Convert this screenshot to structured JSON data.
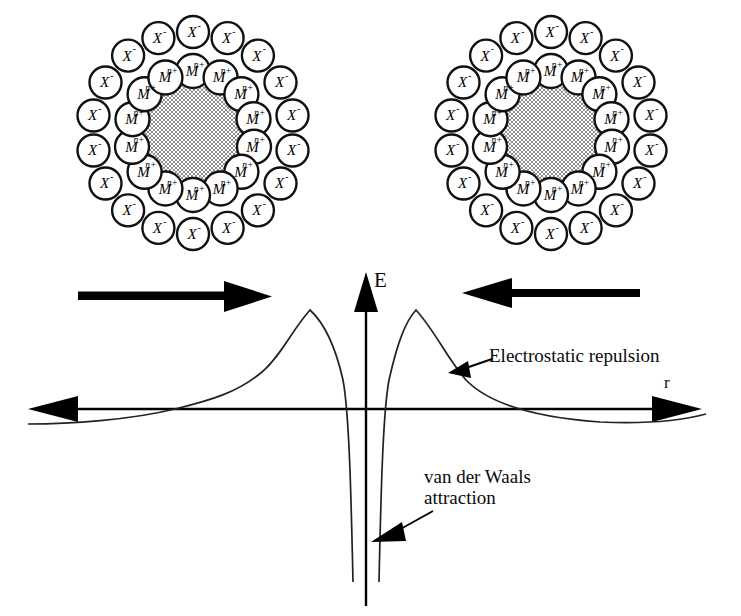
{
  "figure": {
    "type": "dlvo-interaction-energy-diagram",
    "background_color": "#ffffff",
    "stroke_color": "#000000"
  },
  "particles": {
    "core_label": "colloid-core",
    "core_fill_pattern": "checkerboard-gray",
    "core_fill_color": "#8c8c8c",
    "inner_ion": {
      "symbol": "M",
      "charge": "n+",
      "count": 14,
      "name": "metal-cation"
    },
    "outer_ion": {
      "symbol": "X",
      "charge": "-",
      "count": 18,
      "name": "counter-anion"
    },
    "left": {
      "name": "left-colloid-particle",
      "cx": 193,
      "cy": 133
    },
    "right": {
      "name": "right-colloid-particle",
      "cx": 551,
      "cy": 133
    }
  },
  "approach_arrows": {
    "left": {
      "label": "approach-arrow-right",
      "direction": "right",
      "x1": 78,
      "x2": 268,
      "y": 296
    },
    "right": {
      "label": "approach-arrow-left",
      "direction": "left",
      "x1": 638,
      "x2": 462,
      "y": 293
    }
  },
  "axes": {
    "y_label": "E",
    "x_label": "r",
    "y_axis_name": "interaction-energy-axis",
    "x_axis_name": "separation-distance-axis",
    "origin_x": 366,
    "origin_y": 409,
    "x_left_end": 28,
    "x_right_end": 700,
    "y_top_end": 272,
    "y_bottom_end": 606
  },
  "annotations": [
    {
      "name": "electrostatic-repulsion-label",
      "text": "Electrostatic repulsion",
      "lines": [
        "Electrostatic repulsion"
      ],
      "x": 489,
      "y": 345,
      "leader_from": [
        486,
        362
      ],
      "leader_to": [
        451,
        374
      ]
    },
    {
      "name": "van-der-waals-attraction-label",
      "text": "van der Waals attraction",
      "lines": [
        "van der Waals",
        "attraction"
      ],
      "x": 424,
      "y": 466,
      "leader_from": [
        430,
        513
      ],
      "leader_to": [
        373,
        541
      ]
    }
  ],
  "chart_data": {
    "type": "line",
    "title": "",
    "xlabel": "r",
    "ylabel": "E",
    "grid": false,
    "legend": null,
    "symmetry": "mirror-symmetric about the energy axis",
    "axis_ranges": {
      "x": [
        -1,
        1
      ],
      "y": [
        -1,
        1
      ]
    },
    "features": [
      {
        "name": "primary-maximum-left",
        "x": -0.42,
        "y": 0.78
      },
      {
        "name": "primary-maximum-right",
        "x": 0.42,
        "y": 0.78
      },
      {
        "name": "primary-minimum",
        "x": 0.0,
        "y": -1.0
      },
      {
        "name": "secondary-minimum-left",
        "x": -0.82,
        "y": -0.09
      },
      {
        "name": "secondary-minimum-right",
        "x": 0.82,
        "y": -0.09
      },
      {
        "name": "zero-crossing-left-inner",
        "x": -0.18,
        "y": 0.0
      },
      {
        "name": "zero-crossing-right-inner",
        "x": 0.18,
        "y": 0.0
      },
      {
        "name": "zero-crossing-left-outer",
        "x": -0.69,
        "y": 0.0
      },
      {
        "name": "zero-crossing-right-outer",
        "x": 0.69,
        "y": 0.0
      }
    ],
    "series": [
      {
        "name": "total-interaction-energy",
        "points_px": [
          [
            28,
            424
          ],
          [
            60,
            423
          ],
          [
            75,
            422
          ],
          [
            100,
            420
          ],
          [
            130,
            416
          ],
          [
            160,
            411
          ],
          [
            185,
            407
          ],
          [
            205,
            403
          ],
          [
            225,
            396
          ],
          [
            245,
            386
          ],
          [
            262,
            372
          ],
          [
            278,
            352
          ],
          [
            292,
            330
          ],
          [
            302,
            316
          ],
          [
            310,
            310
          ],
          [
            318,
            311
          ],
          [
            326,
            320
          ],
          [
            334,
            339
          ],
          [
            340,
            362
          ],
          [
            345,
            392
          ],
          [
            348,
            420
          ],
          [
            350,
            470
          ],
          [
            352,
            530
          ],
          [
            353,
            582
          ],
          [
            379,
            582
          ],
          [
            380,
            520
          ],
          [
            382,
            460
          ],
          [
            384,
            424
          ],
          [
            386,
            400
          ],
          [
            389,
            372
          ],
          [
            394,
            348
          ],
          [
            400,
            331
          ],
          [
            408,
            317
          ],
          [
            416,
            310
          ],
          [
            424,
            312
          ],
          [
            432,
            324
          ],
          [
            442,
            345
          ],
          [
            452,
            366
          ],
          [
            464,
            384
          ],
          [
            478,
            396
          ],
          [
            495,
            405
          ],
          [
            515,
            412
          ],
          [
            540,
            417
          ],
          [
            570,
            421
          ],
          [
            600,
            423
          ],
          [
            630,
            423
          ],
          [
            660,
            422
          ],
          [
            690,
            419
          ],
          [
            706,
            416
          ]
        ]
      }
    ]
  }
}
